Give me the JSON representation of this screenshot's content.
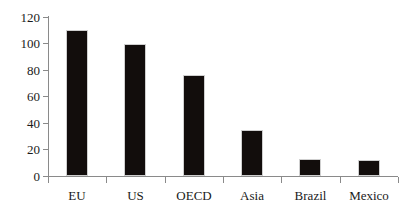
{
  "chart_data": {
    "type": "bar",
    "title": "",
    "subtitle": "",
    "xlabel": "",
    "ylabel": "",
    "categories": [
      "EU",
      "US",
      "OECD",
      "Asia",
      "Brazil",
      "Mexico"
    ],
    "values": [
      110,
      100,
      76,
      35,
      13,
      12
    ],
    "series": [
      {
        "name": "",
        "values": [
          110,
          100,
          76,
          35,
          13,
          12
        ]
      }
    ],
    "ylim": [
      0,
      120
    ],
    "yticks": [
      0,
      20,
      40,
      60,
      80,
      100,
      120
    ],
    "ytick_labels": [
      "0",
      "20",
      "40",
      "60",
      "80",
      "100",
      "120"
    ],
    "grid": false,
    "legend": false,
    "legend_position": "none",
    "annotations": [],
    "colors": {
      "bar_fill": "#120d0c",
      "bar_edge": "#cfcfcf",
      "axis": "#8a8a8a",
      "text": "#1a1a1a",
      "background": "#ffffff"
    }
  }
}
